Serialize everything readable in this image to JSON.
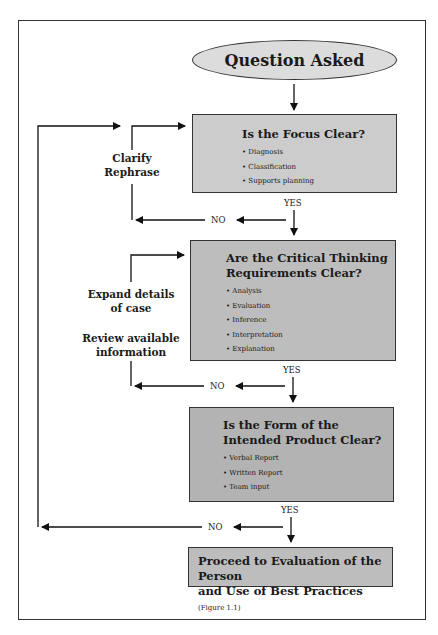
{
  "start": {
    "label": "Question Asked"
  },
  "steps": [
    {
      "title": "Is the Focus Clear?",
      "items": [
        "Diagnosis",
        "Classification",
        "Supports planning"
      ]
    },
    {
      "title_line1": "Are the Critical Thinking",
      "title_line2": "Requirements Clear?",
      "items": [
        "Analysis",
        "Evaluation",
        "Inference",
        "Interpretation",
        "Explanation"
      ]
    },
    {
      "title_line1": "Is the Form of the",
      "title_line2": "Intended Product Clear?",
      "items": [
        "Verbal Report",
        "Written Report",
        "Team input"
      ]
    }
  ],
  "end": {
    "line1": "Proceed to Evaluation of the Person",
    "line2": "and Use of Best Practices",
    "ref": "(Figure 1.1)"
  },
  "side_labels": {
    "clarify": "Clarify",
    "rephrase": "Rephrase",
    "expand1": "Expand details",
    "expand2": "of case",
    "review1": "Review available",
    "review2": "information"
  },
  "branches": {
    "yes": "YES",
    "no": "NO"
  }
}
